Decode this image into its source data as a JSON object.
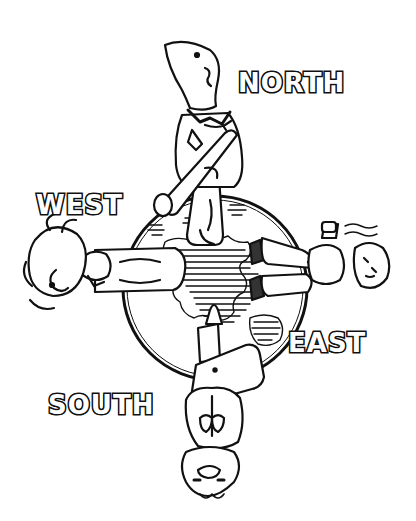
{
  "illustration": {
    "style": "black-and-white line art",
    "line_color": "#111111",
    "background_color": "#ffffff",
    "labels": {
      "north": "NORTH",
      "west": "WEST",
      "east": "EAST",
      "south": "SOUTH"
    },
    "elements": [
      "globe",
      "north-figure",
      "west-figure",
      "east-figure",
      "south-figure"
    ]
  }
}
